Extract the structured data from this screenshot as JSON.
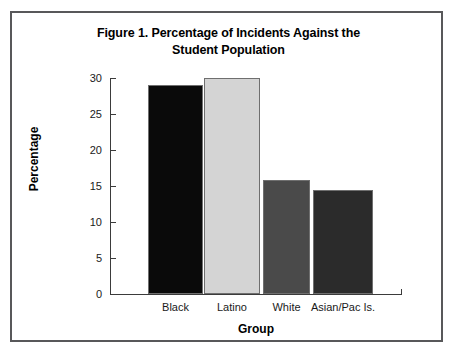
{
  "figure": {
    "title_line1": "Figure 1. Percentage of Incidents Against the",
    "title_line2": "Student Population",
    "border_color": "#58585a"
  },
  "chart_data": {
    "type": "bar",
    "title": "Figure 1. Percentage of Incidents Against the Student Population",
    "xlabel": "Group",
    "ylabel": "Percentage",
    "categories": [
      "Black",
      "Latino",
      "White",
      "Asian/Pac Is."
    ],
    "values": [
      29.0,
      30.0,
      15.8,
      14.5
    ],
    "bar_colors": [
      "#0a0a0a",
      "#d4d4d4",
      "#4a4a4a",
      "#2b2b2b"
    ],
    "ylim": [
      0,
      30
    ],
    "yticks": [
      0,
      5,
      10,
      15,
      20,
      25,
      30
    ],
    "ytick_labels": [
      "0",
      "5",
      "10",
      "15",
      "20",
      "25",
      "30"
    ],
    "grid": false,
    "legend": "none"
  }
}
